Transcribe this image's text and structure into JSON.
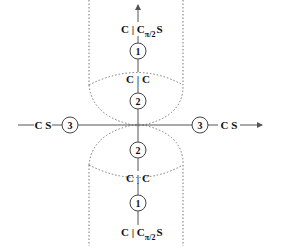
{
  "diagram": {
    "type": "symmetry-decomposition",
    "colors": {
      "line": "#555555",
      "dotted": "#777777",
      "text": "#111111",
      "background": "#ffffff"
    },
    "top_branch": {
      "outer_label": {
        "main": "C | C",
        "sub": "π/2",
        "suffix": "S"
      },
      "node_1": "1",
      "inner_label": "C | C",
      "node_2": "2"
    },
    "bottom_branch": {
      "node_2": "2",
      "inner_label": "C | C",
      "node_1": "1",
      "outer_label": {
        "main": "C | C",
        "sub": "π/2",
        "suffix": "S"
      }
    },
    "left_branch": {
      "label": "C S",
      "node_3": "3"
    },
    "right_branch": {
      "label": "C S",
      "node_3": "3"
    }
  }
}
